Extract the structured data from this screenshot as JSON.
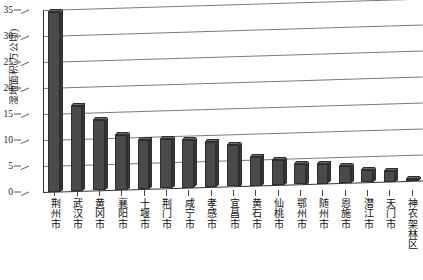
{
  "chart_data": {
    "type": "bar",
    "title": "",
    "subtitle": "",
    "xlabel": "",
    "ylabel": "湿地面积(万公顷)",
    "ylim": [
      0,
      35
    ],
    "ytick_step": 5,
    "ytick_labels": [
      "35",
      "30",
      "25",
      "20",
      "15",
      "10",
      "5",
      "0"
    ],
    "grid": true,
    "legend": "none",
    "bar_color": "#4a4a4a",
    "bar_top_color": "#6b6b6b",
    "bar_side_color": "#3a3a3a",
    "gridline_color": "#7a7a7a",
    "axis_color": "#333333",
    "background": "#ffffff",
    "categories": [
      "荆州市",
      "武汉市",
      "黄冈市",
      "襄阳市",
      "十堰市",
      "荆门市",
      "咸宁市",
      "孝感市",
      "宜昌市",
      "黄石市",
      "仙桃市",
      "鄂州市",
      "随州市",
      "恩施市",
      "潜江市",
      "天门市",
      "神农架林区"
    ],
    "values": [
      34.6,
      16.4,
      13.5,
      10.6,
      9.5,
      9.4,
      9.1,
      8.6,
      8.0,
      5.6,
      4.8,
      4.0,
      3.7,
      3.3,
      2.3,
      2.1,
      0.15
    ]
  }
}
